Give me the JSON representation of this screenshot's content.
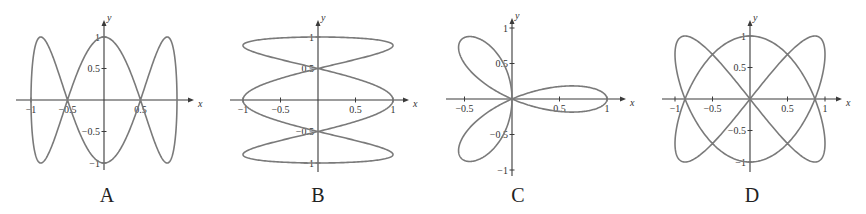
{
  "chart_data": [
    {
      "type": "line",
      "label": "A",
      "title": "",
      "xlabel": "x",
      "ylabel": "y",
      "parametric": {
        "x": "sin(t)",
        "y": "cos(3t)",
        "t_range": [
          0,
          6.2832
        ]
      },
      "xlim": [
        -1.2,
        1.2
      ],
      "ylim": [
        -1.1,
        1.1
      ],
      "x_ticks": [
        -1,
        -0.5,
        0.5
      ],
      "x_tick_labels": [
        "-1",
        "-0.5",
        "0.5"
      ],
      "y_ticks": [
        1,
        0.5,
        -0.5,
        -1
      ],
      "y_tick_labels": [
        "1",
        "0.5",
        "-0.5",
        "-1"
      ],
      "grid": false,
      "features": "curve crosses x-axis at x=±0.5; peaks y=±1 at x=0 and x≈±0.87"
    },
    {
      "type": "line",
      "label": "B",
      "title": "",
      "xlabel": "x",
      "ylabel": "y",
      "parametric": {
        "x": "cos(3t)",
        "y": "sin(t)",
        "t_range": [
          0,
          6.2832
        ]
      },
      "xlim": [
        -1.2,
        1.2
      ],
      "ylim": [
        -1.1,
        1.1
      ],
      "x_ticks": [
        -1,
        -0.5,
        0.5,
        1
      ],
      "x_tick_labels": [
        "-1",
        "-0.5",
        "0.5",
        "1"
      ],
      "y_ticks": [
        1,
        0.5,
        -0.5,
        -1
      ],
      "y_tick_labels": [
        "1",
        "0.5",
        "-0.5",
        "-1"
      ],
      "grid": false,
      "features": "curve crosses y-axis at y=±0.5; extremes x=±1"
    },
    {
      "type": "line",
      "label": "C",
      "title": "",
      "xlabel": "x",
      "ylabel": "y",
      "polar": {
        "r": "cos(3θ)",
        "theta_range": [
          0,
          3.1416
        ]
      },
      "xlim": [
        -0.7,
        1.1
      ],
      "ylim": [
        -1.05,
        1.05
      ],
      "x_ticks": [
        -0.5,
        0.5,
        1
      ],
      "x_tick_labels": [
        "-0.5",
        "0.5",
        "1"
      ],
      "y_ticks": [
        1,
        0.5,
        -0.5,
        -1
      ],
      "y_tick_labels": [
        "1",
        "0.5",
        "-0.5",
        "-1"
      ],
      "grid": false,
      "features": "three-petal rose, petal along +x reaching x=1"
    },
    {
      "type": "line",
      "label": "D",
      "title": "",
      "xlabel": "x",
      "ylabel": "y",
      "parametric": {
        "x": "sin(2t)",
        "y": "cos(3t)",
        "t_range": [
          0,
          6.2832
        ]
      },
      "xlim": [
        -1.2,
        1.2
      ],
      "ylim": [
        -1.1,
        1.1
      ],
      "x_ticks": [
        -1,
        -0.5,
        0.5,
        1
      ],
      "x_tick_labels": [
        "-1",
        "-0.5",
        "0.5",
        "1"
      ],
      "y_ticks": [
        1,
        0.5,
        -0.5,
        -1
      ],
      "y_tick_labels": [
        "1",
        "0.5",
        "-0.5",
        "-1"
      ],
      "grid": false,
      "features": "Lissajous figure through origin; crosses x-axis at x≈±0.87"
    }
  ],
  "panels": [
    {
      "label": "A",
      "origin": [
        104,
        100
      ],
      "scale": [
        73,
        63
      ],
      "xaxis": [
        16,
        190
      ],
      "yaxis": [
        24,
        170
      ],
      "label_pos": [
        107,
        184
      ],
      "x_tick_values": [
        -1,
        -0.5,
        0.5
      ],
      "y_tick_values": [
        1,
        0.5,
        -0.5,
        -1
      ]
    },
    {
      "label": "B",
      "origin": [
        318,
        100
      ],
      "scale": [
        75,
        63
      ],
      "xaxis": [
        230,
        405
      ],
      "yaxis": [
        24,
        172
      ],
      "label_pos": [
        318,
        184
      ],
      "x_tick_values": [
        -1,
        -0.5,
        0.5,
        1
      ],
      "y_tick_values": [
        1,
        0.5,
        -0.5,
        -1
      ]
    },
    {
      "label": "C",
      "origin": [
        512,
        99
      ],
      "scale": [
        95,
        71
      ],
      "xaxis": [
        446,
        622
      ],
      "yaxis": [
        22,
        176
      ],
      "label_pos": [
        518,
        184
      ],
      "x_tick_values": [
        -0.5,
        0.5,
        1
      ],
      "y_tick_values": [
        1,
        0.5,
        -0.5,
        -1
      ]
    },
    {
      "label": "D",
      "origin": [
        750,
        99
      ],
      "scale": [
        75,
        63
      ],
      "xaxis": [
        662,
        838
      ],
      "yaxis": [
        24,
        172
      ],
      "label_pos": [
        752,
        184
      ],
      "x_tick_values": [
        -1,
        -0.5,
        0.5,
        1
      ],
      "y_tick_values": [
        1,
        0.5,
        -0.5,
        -1
      ]
    }
  ],
  "colors": {
    "curve": "#7a7a7a",
    "axis": "#3a3a3a",
    "background": "#ffffff"
  }
}
